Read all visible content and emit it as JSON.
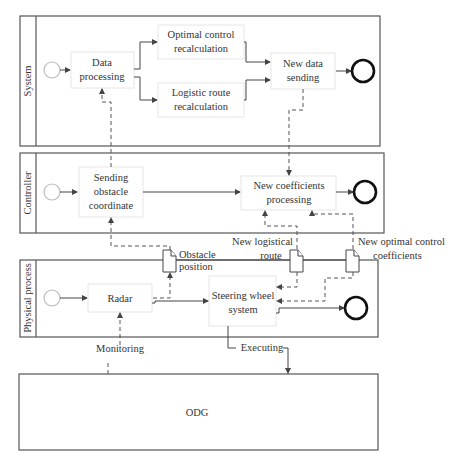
{
  "lanes": {
    "system": "System",
    "controller": "Controller",
    "physical": "Physical process"
  },
  "tasks": {
    "data_processing": [
      "Data",
      "processing"
    ],
    "optimal_control": [
      "Optimal control",
      "recalculation"
    ],
    "logistic_route": [
      "Logistic route",
      "recalculation"
    ],
    "new_data_sending": [
      "New data",
      "sending"
    ],
    "sending_obstacle": [
      "Sending",
      "obstacle",
      "coordinate"
    ],
    "new_coefficients": [
      "New coefficients",
      "processing"
    ],
    "radar": [
      "Radar"
    ],
    "steering": [
      "Steering wheel",
      "system"
    ]
  },
  "data_objects": {
    "obstacle_position": [
      "Obstacle",
      "position"
    ],
    "new_logistical_route": [
      "New logistical",
      "route"
    ],
    "new_optimal_control": [
      "New optimal control",
      "coefficients"
    ]
  },
  "flow_labels": {
    "monitoring": "Monitoring",
    "executing": "Executing"
  },
  "external": {
    "odg": "ODG"
  }
}
